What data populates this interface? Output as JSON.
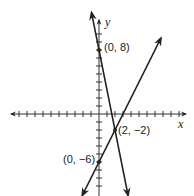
{
  "chart_data": {
    "type": "line",
    "title": "",
    "xlabel": "x",
    "ylabel": "y",
    "xlim": [
      -8,
      11
    ],
    "ylim": [
      -10,
      11
    ],
    "grid": false,
    "tick_spacing": 1,
    "series": [
      {
        "name": "line-1",
        "slope": -5,
        "intercept": 8,
        "points": [
          [
            0,
            8
          ],
          [
            2,
            -2
          ]
        ],
        "color": "#222222"
      },
      {
        "name": "line-2",
        "slope": 2,
        "intercept": -6,
        "points": [
          [
            0,
            -6
          ],
          [
            2,
            -2
          ]
        ],
        "color": "#222222"
      }
    ],
    "annotations": [
      {
        "text": "(0, 8)",
        "x": 0,
        "y": 8
      },
      {
        "text": "(2, −2)",
        "x": 2,
        "y": -2
      },
      {
        "text": "(0, −6)",
        "x": 0,
        "y": -6
      }
    ]
  },
  "labels": {
    "x_axis": "x",
    "y_axis": "y",
    "point_a": "(0, 8)",
    "point_b": "(2, −2)",
    "point_c": "(0, −6)"
  }
}
